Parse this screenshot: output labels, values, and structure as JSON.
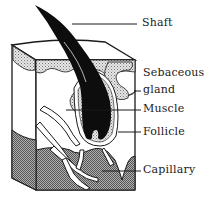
{
  "diagram": {
    "labels": {
      "shaft": "Shaft",
      "sebaceous_gland_line1": "Sebaceous",
      "sebaceous_gland_line2": "gland",
      "muscle": "Muscle",
      "follicle": "Follicle",
      "capillary": "Capillary"
    },
    "colors": {
      "ink": "#1a1a1a",
      "hair": "#0d0d0d",
      "stipple_light": "#d4d4d4",
      "stipple_dark": "#8c8c8c",
      "background": "#ffffff"
    }
  }
}
